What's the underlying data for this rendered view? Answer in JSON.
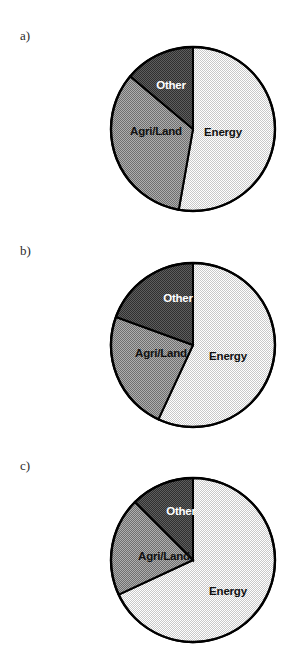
{
  "figure": {
    "background_color": "#ffffff",
    "panel_label_color": "#2b2b2b",
    "outline_color": "#000000"
  },
  "legend_colors": {
    "energy": "#e3e3e3",
    "agri_land": "#8f8f8f",
    "other": "#4a4a4a"
  },
  "panels": [
    {
      "letter": "a)",
      "labels": {
        "energy": "Energy",
        "agri_land": "Agri/Land",
        "other": "Other"
      }
    },
    {
      "letter": "b)",
      "labels": {
        "energy": "Energy",
        "agri_land": "Agri/Land",
        "other": "Other"
      }
    },
    {
      "letter": "c)",
      "labels": {
        "energy": "Energy",
        "agri_land": "Agri/Land",
        "other": "Other"
      }
    }
  ],
  "chart_data": [
    {
      "type": "pie",
      "title": "a)",
      "labels": [
        "Energy",
        "Agri/Land",
        "Other"
      ],
      "values": [
        52.8,
        33.3,
        13.9
      ],
      "units": "percent",
      "start_angle_deg": 0,
      "direction": "clockwise",
      "slice_angles_deg": [
        190,
        120,
        50
      ],
      "colors": [
        "#e3e3e3",
        "#8f8f8f",
        "#4a4a4a"
      ],
      "legend": "inside-slices",
      "grid": false
    },
    {
      "type": "pie",
      "title": "b)",
      "labels": [
        "Energy",
        "Agri/Land",
        "Other"
      ],
      "values": [
        56.9,
        23.6,
        19.5
      ],
      "units": "percent",
      "start_angle_deg": 0,
      "direction": "clockwise",
      "slice_angles_deg": [
        205,
        85,
        70
      ],
      "colors": [
        "#e3e3e3",
        "#8f8f8f",
        "#4a4a4a"
      ],
      "legend": "inside-slices",
      "grid": false
    },
    {
      "type": "pie",
      "title": "c)",
      "labels": [
        "Energy",
        "Agri/Land",
        "Other"
      ],
      "values": [
        68.1,
        19.4,
        12.5
      ],
      "units": "percent",
      "start_angle_deg": 0,
      "direction": "clockwise",
      "slice_angles_deg": [
        245,
        70,
        45
      ],
      "colors": [
        "#e3e3e3",
        "#8f8f8f",
        "#4a4a4a"
      ],
      "legend": "inside-slices",
      "grid": false
    }
  ]
}
